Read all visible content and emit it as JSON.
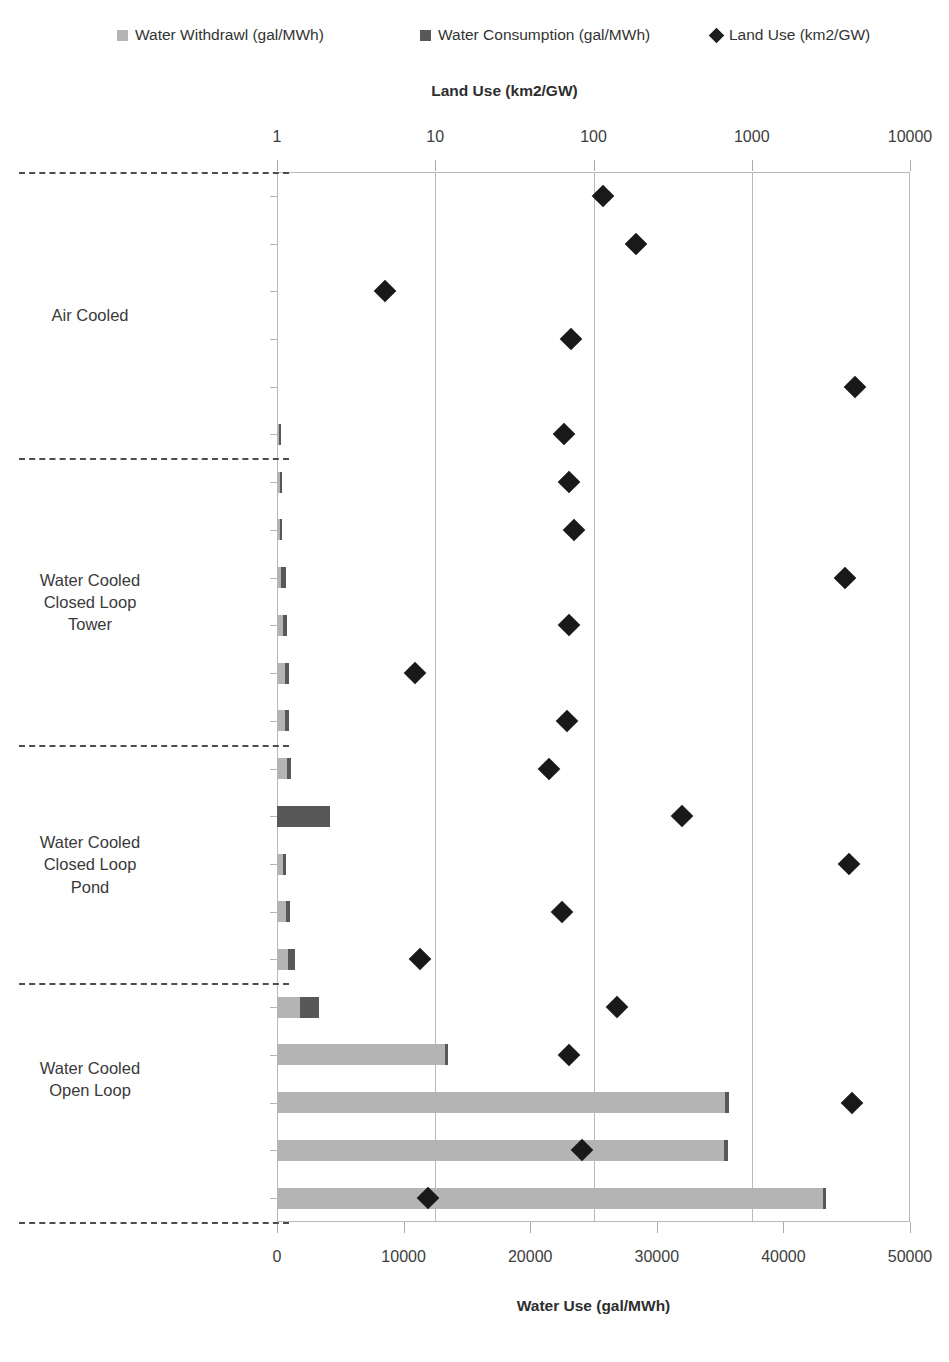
{
  "legend": {
    "items": [
      {
        "label": "Water Withdrawl (gal/MWh)",
        "marker": "square-swatch",
        "color": "#b4b4b4"
      },
      {
        "label": "Water Consumption (gal/MWh)",
        "marker": "square-swatch",
        "color": "#585858"
      },
      {
        "label": "Land Use (km2/GW)",
        "marker": "diamond-marker",
        "color": "#1d1d1d"
      }
    ]
  },
  "axes": {
    "top": {
      "title": "Land Use (km2/GW)",
      "scale": "log",
      "ticks": [
        "1",
        "10",
        "100",
        "1000",
        "10000"
      ],
      "tick_values": [
        1,
        10,
        100,
        1000,
        10000
      ]
    },
    "bottom": {
      "title": "Water Use (gal/MWh)",
      "scale": "linear",
      "ticks": [
        "0",
        "10000",
        "20000",
        "30000",
        "40000",
        "50000"
      ],
      "tick_values": [
        0,
        10000,
        20000,
        30000,
        40000,
        50000
      ],
      "range": [
        0,
        50000
      ]
    }
  },
  "groups": [
    {
      "label": "Air Cooled",
      "rows": [
        0,
        5
      ]
    },
    {
      "label": "Water Cooled\nClosed Loop\nTower",
      "rows": [
        6,
        11
      ]
    },
    {
      "label": "Water Cooled\nClosed Loop\nPond",
      "rows": [
        12,
        16
      ]
    },
    {
      "label": "Water Cooled\nOpen Loop",
      "rows": [
        17,
        20
      ]
    }
  ],
  "chart_data": {
    "type": "bar",
    "title": "",
    "xlabel": "Water Use (gal/MWh)",
    "ylabel": "",
    "secondary_xlabel": "Land Use (km2/GW)",
    "orientation": "horizontal",
    "xlim": [
      0,
      50000
    ],
    "secondary_xlim": [
      1,
      10000
    ],
    "secondary_xscale": "log",
    "grid": "vertical",
    "legend_position": "top",
    "categories": [
      "Solar PV",
      "Wind",
      "Nuclear",
      "Natural Gas",
      "Biomass",
      "Coal",
      "Coal IGCC",
      "Natural Gas",
      "Biomass",
      "Coal",
      "Nuclear",
      "Solar Tower",
      "Solar Trough",
      "Hydroelectric",
      "Biomass",
      "Coal",
      "Nuclear",
      "Geothermal",
      "Natural Gas",
      "Biomass",
      "Coal",
      "Nuclear"
    ],
    "series": [
      {
        "name": "Water Withdrawl (gal/MWh)",
        "type": "bar",
        "axis": "bottom",
        "values": [
          0,
          0,
          0,
          0,
          0,
          160,
          210,
          200,
          350,
          480,
          600,
          650,
          780,
          0,
          480,
          700,
          900,
          1800,
          13300,
          35400,
          35300,
          43100
        ]
      },
      {
        "name": "Water Consumption (gal/MWh)",
        "type": "bar",
        "axis": "bottom",
        "values": [
          0,
          0,
          0,
          0,
          0,
          260,
          380,
          320,
          680,
          800,
          950,
          950,
          1100,
          4200,
          700,
          1050,
          1400,
          3300,
          13500,
          35700,
          35600,
          43400
        ]
      },
      {
        "name": "Land Use (km2/GW)",
        "type": "scatter",
        "axis": "top",
        "values": [
          115,
          185,
          4.8,
          72,
          4500,
          65,
          70,
          75,
          3900,
          70,
          7.5,
          68,
          52,
          360,
          4100,
          63,
          8.0,
          140,
          70,
          4300,
          85,
          9.0
        ]
      }
    ]
  }
}
